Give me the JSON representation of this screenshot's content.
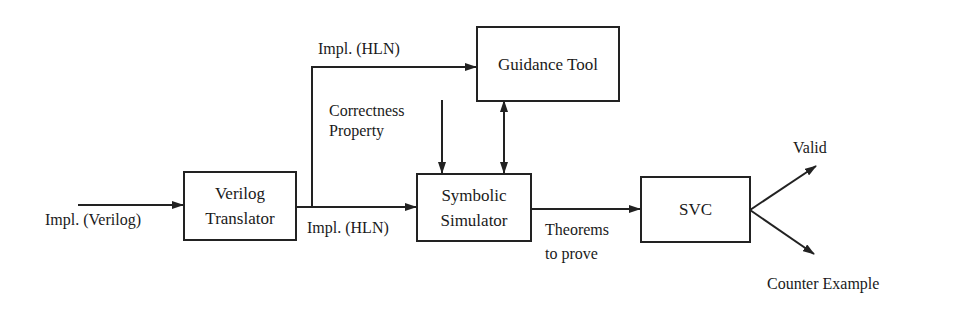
{
  "diagram": {
    "nodes": {
      "verilog_translator": {
        "line1": "Verilog",
        "line2": "Translator"
      },
      "guidance_tool": {
        "label": "Guidance Tool"
      },
      "symbolic_simulator": {
        "line1": "Symbolic",
        "line2": "Simulator"
      },
      "svc": {
        "label": "SVC"
      }
    },
    "edge_labels": {
      "input": "Impl. (Verilog)",
      "hln_top": "Impl. (HLN)",
      "hln_bottom": "Impl. (HLN)",
      "correctness_line1": "Correctness",
      "correctness_line2": "Property",
      "theorems_line1": "Theorems",
      "theorems_line2": "to prove",
      "valid": "Valid",
      "counter_example": "Counter Example"
    },
    "colors": {
      "stroke": "#222222",
      "text": "#1a1a1a",
      "background": "#ffffff"
    }
  }
}
